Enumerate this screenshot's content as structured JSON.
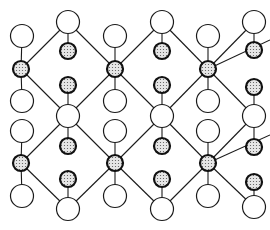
{
  "diagram": {
    "title": "",
    "type": "crystal-lattice-structure",
    "canvas": {
      "width": 270,
      "height": 230
    },
    "colors": {
      "background": "#ffffff",
      "line": "#1a1a1a",
      "large_atom_fill": "#ffffff",
      "small_atom_fill": "#d8d8d8",
      "small_atom_stroke": "#111111"
    },
    "legend": [],
    "atom_types": {
      "large": {
        "description": "large open circle",
        "radius": 11.5
      },
      "small": {
        "description": "small dotted dark-rimmed circle",
        "radius": 8
      }
    },
    "large_atoms": [
      {
        "x": 68,
        "y": 22
      },
      {
        "x": 162,
        "y": 22
      },
      {
        "x": 254,
        "y": 22
      },
      {
        "x": 22,
        "y": 36
      },
      {
        "x": 115,
        "y": 36
      },
      {
        "x": 208,
        "y": 36
      },
      {
        "x": 22,
        "y": 101
      },
      {
        "x": 115,
        "y": 101
      },
      {
        "x": 208,
        "y": 101
      },
      {
        "x": 68,
        "y": 116
      },
      {
        "x": 162,
        "y": 116
      },
      {
        "x": 254,
        "y": 116
      },
      {
        "x": 22,
        "y": 131
      },
      {
        "x": 115,
        "y": 131
      },
      {
        "x": 208,
        "y": 131
      },
      {
        "x": 22,
        "y": 196
      },
      {
        "x": 115,
        "y": 196
      },
      {
        "x": 208,
        "y": 196
      },
      {
        "x": 68,
        "y": 209
      },
      {
        "x": 162,
        "y": 209
      },
      {
        "x": 254,
        "y": 207
      }
    ],
    "small_atoms": [
      {
        "x": 21,
        "y": 69
      },
      {
        "x": 115,
        "y": 69
      },
      {
        "x": 208,
        "y": 69
      },
      {
        "x": 21,
        "y": 163
      },
      {
        "x": 115,
        "y": 163
      },
      {
        "x": 208,
        "y": 163
      },
      {
        "x": 68,
        "y": 51
      },
      {
        "x": 162,
        "y": 51
      },
      {
        "x": 254,
        "y": 50
      },
      {
        "x": 68,
        "y": 85
      },
      {
        "x": 162,
        "y": 85
      },
      {
        "x": 254,
        "y": 87
      },
      {
        "x": 68,
        "y": 146
      },
      {
        "x": 162,
        "y": 146
      },
      {
        "x": 254,
        "y": 147
      },
      {
        "x": 68,
        "y": 179
      },
      {
        "x": 162,
        "y": 179
      },
      {
        "x": 254,
        "y": 182
      }
    ],
    "bonds": [
      [
        22,
        36,
        21,
        69
      ],
      [
        21,
        69,
        22,
        101
      ],
      [
        115,
        36,
        115,
        69
      ],
      [
        115,
        69,
        115,
        101
      ],
      [
        208,
        36,
        208,
        69
      ],
      [
        208,
        69,
        208,
        101
      ],
      [
        22,
        131,
        21,
        163
      ],
      [
        21,
        163,
        22,
        196
      ],
      [
        115,
        131,
        115,
        163
      ],
      [
        115,
        163,
        115,
        196
      ],
      [
        208,
        131,
        208,
        163
      ],
      [
        208,
        163,
        208,
        196
      ],
      [
        68,
        22,
        68,
        51
      ],
      [
        162,
        22,
        162,
        51
      ],
      [
        254,
        22,
        254,
        50
      ],
      [
        68,
        85,
        68,
        116
      ],
      [
        68,
        116,
        68,
        146
      ],
      [
        162,
        85,
        162,
        116
      ],
      [
        162,
        116,
        162,
        146
      ],
      [
        254,
        87,
        254,
        116
      ],
      [
        254,
        116,
        254,
        147
      ],
      [
        68,
        179,
        68,
        209
      ],
      [
        162,
        179,
        162,
        209
      ],
      [
        254,
        182,
        254,
        207
      ],
      [
        21,
        69,
        68,
        22
      ],
      [
        68,
        22,
        115,
        69
      ],
      [
        115,
        69,
        162,
        22
      ],
      [
        162,
        22,
        208,
        69
      ],
      [
        208,
        69,
        254,
        22
      ],
      [
        21,
        69,
        68,
        116
      ],
      [
        68,
        116,
        115,
        69
      ],
      [
        115,
        69,
        162,
        116
      ],
      [
        162,
        116,
        208,
        69
      ],
      [
        208,
        69,
        254,
        116
      ],
      [
        21,
        163,
        68,
        116
      ],
      [
        68,
        116,
        115,
        163
      ],
      [
        115,
        163,
        162,
        116
      ],
      [
        162,
        116,
        208,
        163
      ],
      [
        208,
        163,
        254,
        116
      ],
      [
        21,
        163,
        68,
        209
      ],
      [
        68,
        209,
        115,
        163
      ],
      [
        115,
        163,
        162,
        209
      ],
      [
        162,
        209,
        208,
        163
      ],
      [
        208,
        163,
        254,
        207
      ],
      [
        208,
        69,
        270,
        40
      ],
      [
        208,
        163,
        270,
        135
      ]
    ]
  }
}
